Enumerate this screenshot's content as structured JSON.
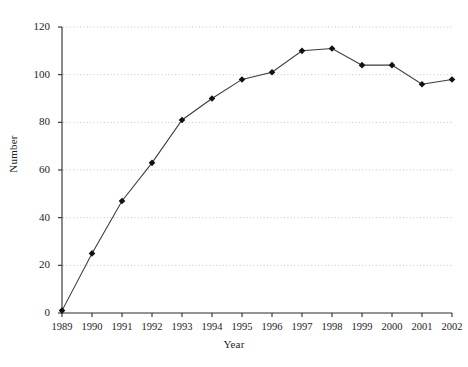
{
  "chart_data": {
    "type": "line",
    "title": "",
    "xlabel": "Year",
    "ylabel": "Number",
    "categories": [
      "1989",
      "1990",
      "1991",
      "1992",
      "1993",
      "1994",
      "1995",
      "1996",
      "1997",
      "1998",
      "1999",
      "2000",
      "2001",
      "2002"
    ],
    "values": [
      1,
      25,
      47,
      63,
      81,
      90,
      98,
      101,
      110,
      111,
      104,
      104,
      96,
      98
    ],
    "series": [
      {
        "name": "Number",
        "values": [
          1,
          25,
          47,
          63,
          81,
          90,
          98,
          101,
          110,
          111,
          104,
          104,
          96,
          98
        ]
      }
    ],
    "ylim": [
      0,
      120
    ],
    "yticks": [
      0,
      20,
      40,
      60,
      80,
      100,
      120
    ],
    "ytick_labels": [
      "0",
      "20",
      "40",
      "60",
      "80",
      "100",
      "120"
    ],
    "xtick_labels": [
      "1989",
      "1990",
      "1991",
      "1992",
      "1993",
      "1994",
      "1995",
      "1996",
      "1997",
      "1998",
      "1999",
      "2000",
      "2001",
      "2002"
    ],
    "grid": "horizontal-dotted",
    "legend": "none",
    "marker": "diamond",
    "marker_color": "#111111",
    "line_color": "#3a3a3a"
  }
}
